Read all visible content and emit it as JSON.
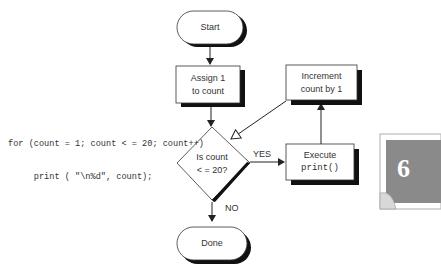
{
  "code": {
    "line1": "for (count = 1; count < = 20; count++)",
    "line2": "     print ( \"\\n%d\", count);"
  },
  "nodes": {
    "start": {
      "label": "Start",
      "shape": "terminator"
    },
    "assign": {
      "label_line1": "Assign 1",
      "label_line2": "to count",
      "shape": "process"
    },
    "decision": {
      "label_line1": "Is count",
      "label_line2": "< = 20?",
      "shape": "decision"
    },
    "execute": {
      "label_line1": "Execute",
      "label_line2": "print()",
      "shape": "process"
    },
    "increment": {
      "label_line1": "Increment",
      "label_line2": "count by 1",
      "shape": "process"
    },
    "done": {
      "label": "Done",
      "shape": "terminator"
    }
  },
  "edges": {
    "yes_label": "YES",
    "no_label": "NO"
  },
  "chapter_tab": {
    "number": "6",
    "color": "#8a8a8a"
  }
}
